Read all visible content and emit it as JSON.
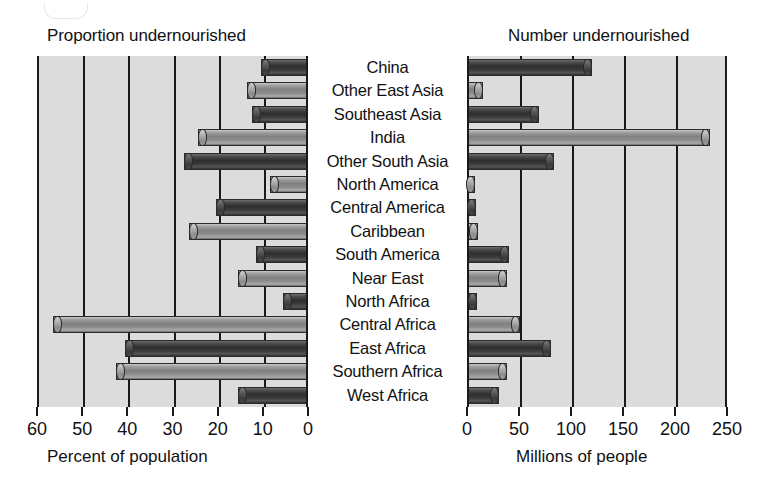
{
  "figure": {
    "left_panel_title": "Proportion undernourished",
    "right_panel_title": "Number undernourished",
    "left_axis_title": "Percent of population",
    "right_axis_title": "Millions of people"
  },
  "chart_data": {
    "type": "bar",
    "orientation": "horizontal",
    "grid": true,
    "legend": "none",
    "categories": [
      "China",
      "Other East Asia",
      "Southeast Asia",
      "India",
      "Other South Asia",
      "North America",
      "Central America",
      "Caribbean",
      "South America",
      "Near East",
      "North Africa",
      "Central Africa",
      "East Africa",
      "Southern Africa",
      "West Africa"
    ],
    "panels": [
      {
        "name": "proportion",
        "title": "Proportion undernourished",
        "xlabel": "Percent of population",
        "ylabel": "",
        "xlim": [
          60,
          0
        ],
        "reversed": true,
        "xticks": [
          60,
          50,
          40,
          30,
          20,
          10,
          0
        ],
        "values": [
          10,
          13,
          12,
          24,
          27,
          8,
          20,
          26,
          11,
          15,
          5,
          56,
          40,
          42,
          15
        ]
      },
      {
        "name": "number",
        "title": "Number undernourished",
        "xlabel": "Millions of people",
        "ylabel": "",
        "xlim": [
          0,
          250
        ],
        "reversed": false,
        "xticks": [
          0,
          50,
          100,
          150,
          200,
          250
        ],
        "values": [
          118,
          13,
          67,
          232,
          82,
          5,
          7,
          9,
          38,
          37,
          8,
          49,
          79,
          37,
          29
        ]
      }
    ]
  },
  "style": {
    "plot_background": "#dcdcdc",
    "axis_color": "#1a1a1a",
    "bar_dark": "#3a3a3a",
    "bar_light": "#9d9d9d",
    "page_background": "#ffffff"
  }
}
